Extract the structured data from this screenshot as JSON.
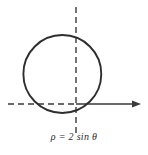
{
  "figure": {
    "caption": "ρ = 2 sin θ",
    "background_color": "#ffffff",
    "stroke_color": "#3a3a3a",
    "curve_color": "#2e2e2e"
  },
  "chart_data": {
    "type": "line",
    "title": "ρ = 2 sin θ",
    "subtitle": "",
    "xlabel": "",
    "ylabel": "",
    "coordinate_system": "polar",
    "equation": "ρ = 2 sin θ",
    "curve_description": "circle of radius 1 centered at (0, 1) in rectangular coordinates, tangent to the polar axis at the pole",
    "grid": false,
    "legend": null,
    "annotations": [
      {
        "text": "ρ = 2 sin θ",
        "position": "below-axis-centered"
      }
    ],
    "axes": [
      {
        "name": "polar-axis",
        "orientation": "horizontal",
        "style_left_of_pole": "dashed",
        "style_right_of_pole": "solid",
        "arrowhead": "right"
      },
      {
        "name": "theta-pi-over-2-axis",
        "orientation": "vertical",
        "style": "dashed",
        "arrowhead": "none"
      }
    ],
    "series": [
      {
        "name": "ρ = 2 sin θ",
        "theta_degrees": [
          0,
          15,
          30,
          45,
          60,
          75,
          90,
          105,
          120,
          135,
          150,
          165,
          180
        ],
        "rho": [
          0,
          0.518,
          1.0,
          1.414,
          1.732,
          1.932,
          2.0,
          1.932,
          1.732,
          1.414,
          1.0,
          0.518,
          0
        ],
        "x": [
          0,
          0.5,
          0.866,
          1.0,
          0.866,
          0.5,
          0,
          -0.5,
          -0.866,
          -1.0,
          -0.866,
          -0.5,
          0
        ],
        "y": [
          0,
          0.134,
          0.5,
          1.0,
          1.5,
          1.866,
          2.0,
          1.866,
          1.5,
          1.0,
          0.5,
          0.134,
          0
        ]
      }
    ],
    "xlim": [
      -1.6,
      2.2
    ],
    "ylim": [
      -0.9,
      2.9
    ]
  }
}
